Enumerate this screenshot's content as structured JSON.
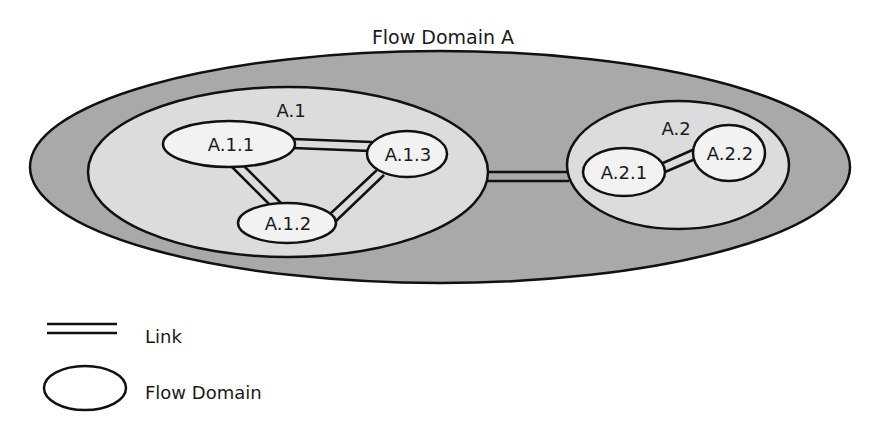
{
  "diagram": {
    "title": "Flow Domain A",
    "colors": {
      "outer_fill": "#a9a9a9",
      "subdomain_fill": "#dcdcdc",
      "node_fill": "#f2f2f2",
      "stroke": "#111111"
    },
    "subdomains": [
      {
        "id": "A.1",
        "label": "A.1"
      },
      {
        "id": "A.2",
        "label": "A.2"
      }
    ],
    "nodes": [
      {
        "id": "A.1.1",
        "label": "A.1.1",
        "domain": "A.1"
      },
      {
        "id": "A.1.2",
        "label": "A.1.2",
        "domain": "A.1"
      },
      {
        "id": "A.1.3",
        "label": "A.1.3",
        "domain": "A.1"
      },
      {
        "id": "A.2.1",
        "label": "A.2.1",
        "domain": "A.2"
      },
      {
        "id": "A.2.2",
        "label": "A.2.2",
        "domain": "A.2"
      }
    ],
    "links": [
      {
        "from": "A.1.1",
        "to": "A.1.3"
      },
      {
        "from": "A.1.1",
        "to": "A.1.2"
      },
      {
        "from": "A.1.2",
        "to": "A.1.3"
      },
      {
        "from": "A.1",
        "to": "A.2"
      },
      {
        "from": "A.2.1",
        "to": "A.2.2"
      }
    ]
  },
  "legend": {
    "items": [
      {
        "symbol": "double-line",
        "label": "Link"
      },
      {
        "symbol": "ellipse",
        "label": "Flow Domain"
      }
    ]
  }
}
